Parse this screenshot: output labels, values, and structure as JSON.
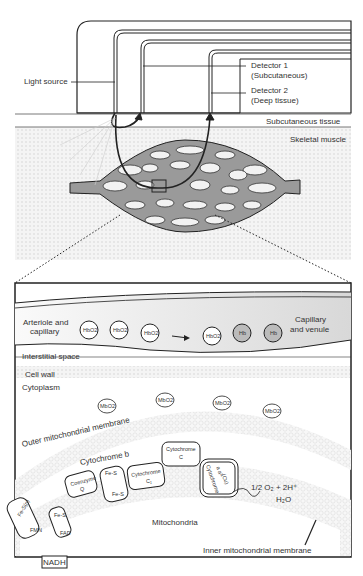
{
  "top": {
    "light_source": "Light source",
    "detector1_line1": "Detector 1",
    "detector1_line2": "(Subcutaneous)",
    "detector2_line1": "Detector 2",
    "detector2_line2": "(Deep tissue)",
    "subcutaneous": "Subcutaneous tissue",
    "skeletal": "Skeletal muscle"
  },
  "detail": {
    "arteriole_line1": "Arteriole and",
    "arteriole_line2": "capillary",
    "venule_line1": "Capillary",
    "venule_line2": "and venule",
    "hb_cells": [
      "HbO2",
      "HbO2",
      "HbO2",
      "HbO2",
      "Hb",
      "Hb"
    ],
    "interstitial": "Interstitial space",
    "cell_wall": "Cell wall",
    "cytoplasm": "Cytoplasm",
    "mb_cells": [
      "MbO2",
      "MbO2",
      "MbO2",
      "MbO2"
    ],
    "outer_membrane": "Outer mitochondrial membrane",
    "cyt_b": "Cytochrome b",
    "mitochondria": "Mitochondria",
    "inner_membrane": "Inner mitochondrial membrane",
    "reaction1": "1/2 O₂ + 2H⁺",
    "reaction2": "H₂O",
    "nadh": "NADH",
    "complexes": {
      "fesn": "Fe-S(n)",
      "fmn": "FMN",
      "fes_a": "Fe-S",
      "fad": "FAD",
      "coq1": "Coenzyme",
      "coq2": "Q",
      "fes_b1": "Fe-S",
      "fes_b2": "Fe-S",
      "cytc1_1": "Cytochrome",
      "cytc1_2": "C₁",
      "cytc_1": "Cytochrome",
      "cytc_2": "C",
      "cytaa3_1": "Cytochrome",
      "cytaa3_2": "a a³",
      "cytaa3_3": "(Cu)"
    }
  }
}
